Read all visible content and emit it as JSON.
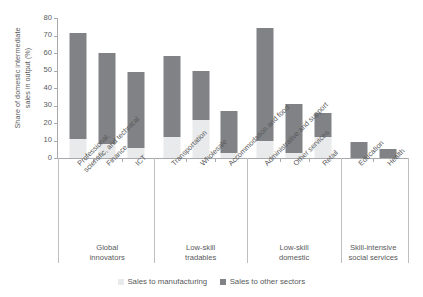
{
  "chart_data": {
    "type": "bar",
    "title": "",
    "subtitle": "",
    "xlabel": "",
    "ylabel": "Share of domestic intermediate\nsales in output (%)",
    "ylim": [
      0,
      80
    ],
    "yticks": [
      0,
      10,
      20,
      30,
      40,
      50,
      60,
      70,
      80
    ],
    "grid": false,
    "stacked": true,
    "legend_position": "bottom-center",
    "categories": [
      "Professional,\nscientific, and technical",
      "Finance",
      "ICT",
      "Transportation",
      "Wholesale",
      "Accommodation and food",
      "Administrative and support",
      "Other services",
      "Retail",
      "Education",
      "Health"
    ],
    "series": [
      {
        "name": "Sales to manufacturing",
        "color": "#e9eaeb",
        "values": [
          11.0,
          7.8,
          5.5,
          12.0,
          21.8,
          2.6,
          9.7,
          2.9,
          11.8,
          0.0,
          0.0
        ]
      },
      {
        "name": "Sales to other sectors",
        "color": "#808285",
        "values": [
          60.2,
          52.1,
          43.4,
          46.5,
          27.9,
          24.5,
          64.8,
          28.1,
          14.2,
          9.2,
          5.2
        ]
      }
    ],
    "totals": [
      71.2,
      59.9,
      48.9,
      58.5,
      49.7,
      27.1,
      74.5,
      31.0,
      26.0,
      9.2,
      5.2
    ],
    "groups": [
      {
        "label": "Global\ninnovators",
        "categories": [
          "Professional,\nscientific, and technical",
          "Finance",
          "ICT"
        ]
      },
      {
        "label": "Low-skill\ntradables",
        "categories": [
          "Transportation",
          "Wholesale",
          "Accommodation and food"
        ]
      },
      {
        "label": "Low-skill\ndomestic",
        "categories": [
          "Administrative and support",
          "Other services",
          "Retail"
        ]
      },
      {
        "label": "Skill-intensive\nsocial services",
        "categories": [
          "Education",
          "Health"
        ]
      }
    ]
  },
  "legend": {
    "items": [
      {
        "label": "Sales to manufacturing",
        "swatch": "light"
      },
      {
        "label": "Sales to other sectors",
        "swatch": "dark"
      }
    ]
  },
  "colors": {
    "dark_gray": "#808285",
    "light_gray": "#e9eaeb",
    "axis": "#a7a9ac",
    "text": "#58595b",
    "background": "#ffffff"
  }
}
